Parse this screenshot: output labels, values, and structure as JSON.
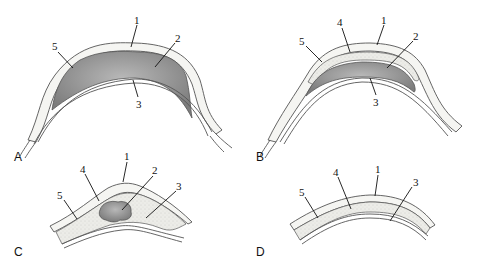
{
  "figure": {
    "panels": [
      {
        "id": "A",
        "label": "A",
        "callouts": [
          "1",
          "2",
          "3",
          "5"
        ]
      },
      {
        "id": "B",
        "label": "B",
        "callouts": [
          "1",
          "2",
          "3",
          "4",
          "5"
        ]
      },
      {
        "id": "C",
        "label": "C",
        "callouts": [
          "1",
          "2",
          "3",
          "4",
          "5"
        ]
      },
      {
        "id": "D",
        "label": "D",
        "callouts": [
          "1",
          "3",
          "4",
          "5"
        ]
      }
    ],
    "colors": {
      "outer_layer": "#f4f4f2",
      "fluid_dark": "#8a8a8a",
      "fluid_light": "#b5b5b5",
      "stipple_layer": "#e6e6e2",
      "line": "#555555"
    }
  }
}
